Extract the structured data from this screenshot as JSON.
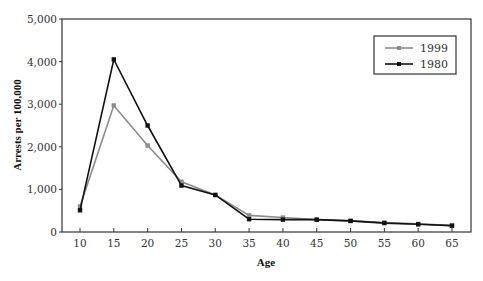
{
  "chart_data": {
    "type": "line",
    "title": "",
    "xlabel": "Age",
    "ylabel": "Arrests per 100,000",
    "x": [
      10,
      15,
      20,
      25,
      30,
      35,
      40,
      45,
      50,
      55,
      60,
      65
    ],
    "x_tick_labels": [
      "10",
      "15",
      "20",
      "25",
      "30",
      "35",
      "40",
      "45",
      "50",
      "55",
      "60",
      "65"
    ],
    "y_tick_values": [
      0,
      1000,
      2000,
      3000,
      4000,
      5000
    ],
    "y_tick_labels": [
      "0",
      "1,000",
      "2,000",
      "3,000",
      "4,000",
      "5,000"
    ],
    "ylim": [
      0,
      5000
    ],
    "xlim": [
      7.5,
      67.5
    ],
    "grid": false,
    "legend_position": "upper right (inside)",
    "series": [
      {
        "name": "1999",
        "color": "#8c8c8c",
        "marker": "square",
        "values": [
          600,
          2970,
          2030,
          1180,
          870,
          390,
          340,
          290,
          260,
          220,
          190,
          150
        ]
      },
      {
        "name": "1980",
        "color": "#111111",
        "marker": "square",
        "values": [
          510,
          4050,
          2500,
          1090,
          870,
          300,
          290,
          290,
          260,
          210,
          180,
          150
        ]
      }
    ]
  },
  "legend": {
    "items": [
      {
        "label": "1999",
        "color": "#8c8c8c"
      },
      {
        "label": "1980",
        "color": "#111111"
      }
    ]
  }
}
